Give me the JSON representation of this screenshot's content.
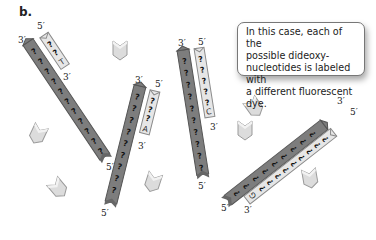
{
  "panel_label": "b.",
  "callout": {
    "lines": [
      "In this case, each of the",
      "possible dideoxy-",
      "nucleotides is labeled with",
      "a different fluorescent dye."
    ]
  },
  "strands": [
    {
      "id": "template-1",
      "type": "template",
      "end_top": "3′",
      "end_bottom": "5′",
      "symbol": "?"
    },
    {
      "id": "product-T",
      "type": "product",
      "end_top": "5′",
      "end_bottom": "3′",
      "terminal_base": "T",
      "symbol": "?"
    },
    {
      "id": "template-2",
      "type": "template",
      "end_top": "3′",
      "end_bottom": "5′",
      "symbol": "?"
    },
    {
      "id": "product-A",
      "type": "product",
      "end_top": "5′",
      "end_bottom": "3′",
      "terminal_base": "A",
      "symbol": "?"
    },
    {
      "id": "template-3",
      "type": "template",
      "end_top": "3′",
      "end_bottom": "5′",
      "symbol": "?"
    },
    {
      "id": "product-C",
      "type": "product",
      "end_top": "5′",
      "end_bottom": "3′",
      "terminal_base": "C",
      "symbol": "?"
    },
    {
      "id": "template-4",
      "type": "template",
      "end_top": "3′",
      "end_bottom": "5′",
      "symbol": "?"
    },
    {
      "id": "product-G",
      "type": "product",
      "end_top": "5′",
      "end_bottom": "3′",
      "terminal_base": "G",
      "symbol": "?"
    }
  ],
  "free_nucleotides": 7,
  "colors": {
    "template_fill": "#7d7d7d",
    "template_edge": "#555555",
    "product_fill": "#e6e6e6",
    "product_edge": "#8a8a8a",
    "nucleotide_fill": "#dcdcdc",
    "nucleotide_edge": "#9a9a9a"
  }
}
